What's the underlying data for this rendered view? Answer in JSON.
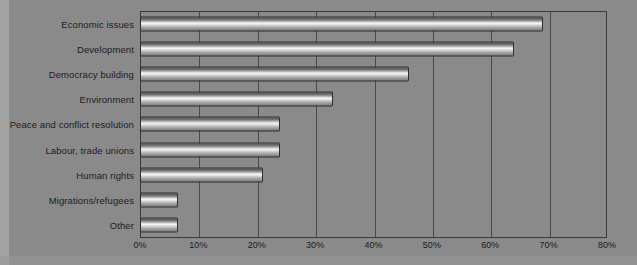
{
  "chart_data": {
    "type": "bar",
    "orientation": "horizontal",
    "title": "",
    "xlabel": "",
    "ylabel": "",
    "xlim": [
      0,
      80
    ],
    "xtick_step": 10,
    "grid": true,
    "legend": "none",
    "tick_labels": [
      "0%",
      "10%",
      "20%",
      "30%",
      "40%",
      "50%",
      "60%",
      "70%",
      "80%"
    ],
    "categories": [
      "Economic issues",
      "Development",
      "Democracy building",
      "Environment",
      "Peace and conflict resolution",
      "Labour, trade unions",
      "Human rights",
      "Migrations/refugees",
      "Other"
    ],
    "values": [
      69,
      64,
      46,
      33,
      24,
      24,
      21,
      6.5,
      6.5
    ],
    "value_unit": "%"
  },
  "style": {
    "background": "#8a8a8a",
    "frame_color": "#3a3a3a",
    "gridline_color": "#4a4a4a",
    "bar_outline": "#2e2e2e",
    "text_color": "#1c1c1c"
  }
}
